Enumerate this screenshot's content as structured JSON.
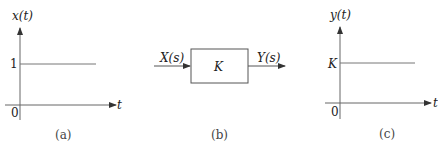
{
  "panels": {
    "a": {
      "y_label": "x(t)",
      "x_label": "t",
      "origin": "0",
      "level_label": "1",
      "caption": "(a)"
    },
    "b": {
      "input_label": "X(s)",
      "output_label": "Y(s)",
      "block_label": "K",
      "caption": "(b)"
    },
    "c": {
      "y_label": "y(t)",
      "x_label": "t",
      "origin": "0",
      "level_label": "K",
      "caption": "(c)"
    }
  },
  "colors": {
    "line": "#555555",
    "text": "#222222"
  }
}
